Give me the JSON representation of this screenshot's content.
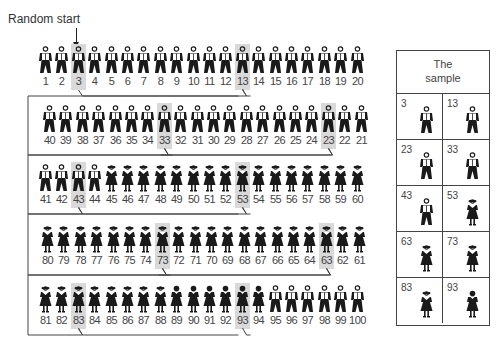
{
  "title": "Random start",
  "sample_box": {
    "title_line1": "The",
    "title_line2": "sample"
  },
  "interval": 10,
  "random_start": 3,
  "colors": {
    "highlight": "#d9d9d9",
    "ink": "#1a1a1a",
    "line": "#444444"
  },
  "rows": [
    {
      "order": [
        1,
        2,
        3,
        4,
        5,
        6,
        7,
        8,
        9,
        10,
        11,
        12,
        13,
        14,
        15,
        16,
        17,
        18,
        19,
        20
      ],
      "x0": 38,
      "y": 44,
      "step": 16.4
    },
    {
      "order": [
        40,
        39,
        38,
        37,
        36,
        35,
        34,
        33,
        32,
        31,
        30,
        29,
        28,
        27,
        26,
        25,
        24,
        23,
        22,
        21
      ],
      "x0": 42,
      "y": 103,
      "step": 16.4
    },
    {
      "order": [
        41,
        42,
        43,
        44,
        45,
        46,
        47,
        48,
        49,
        50,
        51,
        52,
        53,
        54,
        55,
        56,
        57,
        58,
        59,
        60
      ],
      "x0": 38,
      "y": 162,
      "step": 16.4
    },
    {
      "order": [
        80,
        79,
        78,
        77,
        76,
        75,
        74,
        73,
        72,
        71,
        70,
        69,
        68,
        67,
        66,
        65,
        64,
        63,
        62,
        61
      ],
      "x0": 40,
      "y": 223,
      "step": 16.4
    },
    {
      "order": [
        81,
        82,
        83,
        84,
        85,
        86,
        87,
        88,
        89,
        90,
        91,
        92,
        93,
        94,
        95,
        96,
        97,
        98,
        99,
        100
      ],
      "x0": 38,
      "y": 283,
      "step": 16.4
    }
  ],
  "figure_types": {
    "man": "1-44,95-100",
    "woman": "45-88",
    "woman_dark": "89-94"
  },
  "sample": [
    {
      "n": "3",
      "type": "man"
    },
    {
      "n": "13",
      "type": "man"
    },
    {
      "n": "23",
      "type": "man"
    },
    {
      "n": "33",
      "type": "man"
    },
    {
      "n": "43",
      "type": "man"
    },
    {
      "n": "53",
      "type": "woman"
    },
    {
      "n": "63",
      "type": "woman"
    },
    {
      "n": "73",
      "type": "woman"
    },
    {
      "n": "83",
      "type": "woman"
    },
    {
      "n": "93",
      "type": "woman_dark"
    }
  ]
}
